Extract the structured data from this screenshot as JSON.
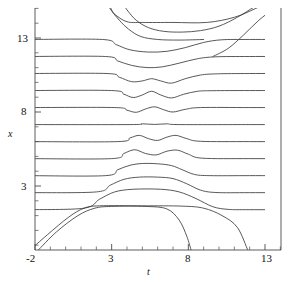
{
  "figure": {
    "background": "#ffffff",
    "line_color": "#3b3b3b",
    "axis_color": "#4a4a4a"
  },
  "axes": {
    "x_title": "t",
    "y_title": "x",
    "x_ticks_labeled": [
      "-2",
      "3",
      "8",
      "13"
    ],
    "y_ticks_labeled": [
      "3",
      "8",
      "13"
    ]
  },
  "chart_data": {
    "type": "line",
    "title": "",
    "xlabel": "t",
    "ylabel": "x",
    "xlim": [
      -2.4,
      15.2
    ],
    "ylim": [
      -1.4,
      15.6
    ],
    "grid": false,
    "legend": null,
    "x_ticks_labeled": [
      -2,
      3,
      8,
      13
    ],
    "x_ticks_minor_step": 1,
    "y_ticks_labeled": [
      3,
      8,
      13
    ],
    "y_ticks_minor_step": 1,
    "baseline_count": 13,
    "baselines": [
      14.05,
      12.9,
      11.75,
      10.6,
      9.45,
      8.3,
      7.15,
      6.0,
      4.85,
      3.7,
      2.55,
      1.4,
      0.3
    ],
    "series": [
      {
        "name": "trace-1-top-kink-pair",
        "baseline": 14.05,
        "kind": "kink-pair-outbound",
        "points": [
          [
            -2.4,
            15.6
          ],
          [
            2.1,
            15.6
          ],
          [
            3.2,
            14.6
          ],
          [
            4.0,
            14.1
          ],
          [
            5.0,
            14.05
          ],
          [
            7.0,
            14.05
          ],
          [
            9.2,
            14.05
          ],
          [
            11.0,
            14.4
          ],
          [
            12.4,
            15.0
          ],
          [
            13.6,
            15.6
          ]
        ]
      },
      {
        "name": "trace-2-deep-well",
        "baseline": 12.9,
        "kind": "broad-well",
        "points": [
          [
            -2.4,
            12.9
          ],
          [
            2.4,
            12.9
          ],
          [
            3.3,
            12.55
          ],
          [
            4.2,
            12.2
          ],
          [
            5.4,
            12.05
          ],
          [
            6.6,
            12.1
          ],
          [
            7.8,
            12.35
          ],
          [
            9.0,
            12.7
          ],
          [
            10.2,
            12.88
          ],
          [
            12.0,
            12.9
          ],
          [
            15.2,
            12.9
          ]
        ]
      },
      {
        "name": "trace-3-well",
        "baseline": 11.75,
        "kind": "well",
        "points": [
          [
            -2.4,
            11.75
          ],
          [
            2.6,
            11.75
          ],
          [
            3.4,
            11.45
          ],
          [
            4.3,
            11.15
          ],
          [
            5.3,
            11.0
          ],
          [
            6.3,
            11.05
          ],
          [
            7.4,
            11.3
          ],
          [
            8.6,
            11.6
          ],
          [
            9.8,
            11.73
          ],
          [
            12.0,
            11.75
          ],
          [
            15.2,
            11.75
          ]
        ]
      },
      {
        "name": "trace-4-double-well",
        "baseline": 10.6,
        "kind": "double-well",
        "points": [
          [
            -2.4,
            10.6
          ],
          [
            2.7,
            10.6
          ],
          [
            3.5,
            10.35
          ],
          [
            4.3,
            10.05
          ],
          [
            5.0,
            10.1
          ],
          [
            5.6,
            10.25
          ],
          [
            6.2,
            10.1
          ],
          [
            6.9,
            9.95
          ],
          [
            7.8,
            10.25
          ],
          [
            8.8,
            10.5
          ],
          [
            9.9,
            10.58
          ],
          [
            12.0,
            10.6
          ],
          [
            15.2,
            10.6
          ]
        ]
      },
      {
        "name": "trace-5-split-well",
        "baseline": 9.45,
        "kind": "double-well",
        "points": [
          [
            -2.4,
            9.45
          ],
          [
            3.0,
            9.45
          ],
          [
            3.8,
            9.2
          ],
          [
            4.4,
            8.98
          ],
          [
            5.0,
            9.15
          ],
          [
            5.6,
            9.4
          ],
          [
            6.2,
            9.15
          ],
          [
            6.9,
            8.95
          ],
          [
            7.7,
            9.2
          ],
          [
            8.6,
            9.4
          ],
          [
            9.6,
            9.44
          ],
          [
            12.0,
            9.45
          ],
          [
            15.2,
            9.45
          ]
        ]
      },
      {
        "name": "trace-6-shallow-wells",
        "baseline": 8.3,
        "kind": "double-well-shallow",
        "points": [
          [
            -2.4,
            8.3
          ],
          [
            3.2,
            8.3
          ],
          [
            4.0,
            8.12
          ],
          [
            4.6,
            7.98
          ],
          [
            5.2,
            8.2
          ],
          [
            5.8,
            8.35
          ],
          [
            6.4,
            8.15
          ],
          [
            7.0,
            8.0
          ],
          [
            7.8,
            8.18
          ],
          [
            8.8,
            8.3
          ],
          [
            12.0,
            8.3
          ],
          [
            15.2,
            8.3
          ]
        ]
      },
      {
        "name": "trace-7-neutral",
        "baseline": 7.15,
        "kind": "flat",
        "points": [
          [
            -2.4,
            7.15
          ],
          [
            4.2,
            7.15
          ],
          [
            5.0,
            7.2
          ],
          [
            5.8,
            7.16
          ],
          [
            6.6,
            7.2
          ],
          [
            7.4,
            7.15
          ],
          [
            12.0,
            7.15
          ],
          [
            15.2,
            7.15
          ]
        ]
      },
      {
        "name": "trace-8-twin-bumps",
        "baseline": 6.0,
        "kind": "double-bump",
        "points": [
          [
            -2.4,
            6.0
          ],
          [
            3.4,
            6.0
          ],
          [
            4.2,
            6.25
          ],
          [
            4.8,
            6.42
          ],
          [
            5.4,
            6.2
          ],
          [
            6.0,
            6.08
          ],
          [
            6.6,
            6.3
          ],
          [
            7.2,
            6.42
          ],
          [
            7.9,
            6.2
          ],
          [
            8.8,
            6.02
          ],
          [
            12.0,
            6.0
          ],
          [
            15.2,
            6.0
          ]
        ]
      },
      {
        "name": "trace-9-merging-bumps",
        "baseline": 4.85,
        "kind": "double-bump",
        "points": [
          [
            -2.4,
            4.85
          ],
          [
            3.0,
            4.85
          ],
          [
            3.8,
            5.2
          ],
          [
            4.5,
            5.45
          ],
          [
            5.2,
            5.2
          ],
          [
            5.9,
            5.1
          ],
          [
            6.6,
            5.35
          ],
          [
            7.3,
            5.42
          ],
          [
            8.0,
            5.15
          ],
          [
            8.9,
            4.88
          ],
          [
            12.0,
            4.85
          ],
          [
            15.2,
            4.85
          ]
        ]
      },
      {
        "name": "trace-10-broad-bump",
        "baseline": 3.7,
        "kind": "broad-bump",
        "points": [
          [
            -2.4,
            3.7
          ],
          [
            2.6,
            3.7
          ],
          [
            3.4,
            4.1
          ],
          [
            4.2,
            4.4
          ],
          [
            5.0,
            4.52
          ],
          [
            6.0,
            4.5
          ],
          [
            6.9,
            4.38
          ],
          [
            7.6,
            4.1
          ],
          [
            8.4,
            3.78
          ],
          [
            9.4,
            3.7
          ],
          [
            12.0,
            3.7
          ],
          [
            15.2,
            3.7
          ]
        ]
      },
      {
        "name": "trace-11-plateau-bump",
        "baseline": 2.55,
        "kind": "plateau",
        "points": [
          [
            -2.4,
            2.55
          ],
          [
            2.0,
            2.6
          ],
          [
            2.9,
            3.05
          ],
          [
            3.8,
            3.45
          ],
          [
            4.8,
            3.6
          ],
          [
            6.0,
            3.6
          ],
          [
            7.0,
            3.5
          ],
          [
            7.9,
            3.15
          ],
          [
            8.8,
            2.72
          ],
          [
            9.8,
            2.56
          ],
          [
            12.0,
            2.55
          ],
          [
            15.2,
            2.55
          ]
        ]
      },
      {
        "name": "trace-12-wide-plateau",
        "baseline": 1.4,
        "kind": "plateau",
        "points": [
          [
            -2.4,
            1.4
          ],
          [
            1.2,
            1.5
          ],
          [
            2.2,
            2.1
          ],
          [
            3.2,
            2.6
          ],
          [
            4.4,
            2.78
          ],
          [
            6.2,
            2.78
          ],
          [
            7.4,
            2.6
          ],
          [
            8.5,
            2.15
          ],
          [
            9.6,
            1.6
          ],
          [
            10.6,
            1.42
          ],
          [
            12.0,
            1.4
          ],
          [
            15.2,
            1.4
          ]
        ]
      },
      {
        "name": "trace-13-bottom-kink-plateau",
        "baseline": 0.3,
        "kind": "plateau-wide",
        "points": [
          [
            -2.4,
            -1.4
          ],
          [
            -1.2,
            -0.3
          ],
          [
            0.2,
            0.9
          ],
          [
            1.2,
            1.5
          ],
          [
            2.2,
            1.66
          ],
          [
            5.0,
            1.66
          ],
          [
            7.6,
            1.64
          ],
          [
            9.0,
            1.5
          ],
          [
            10.2,
            1.0
          ],
          [
            11.2,
            0.2
          ],
          [
            11.9,
            -1.4
          ]
        ]
      },
      {
        "name": "trace-14-bottom-kink-steep",
        "baseline": null,
        "kind": "kink-steep",
        "points": [
          [
            -1.85,
            -1.4
          ],
          [
            -0.6,
            -0.1
          ],
          [
            0.8,
            1.0
          ],
          [
            1.9,
            1.5
          ],
          [
            3.0,
            1.62
          ],
          [
            5.2,
            1.62
          ],
          [
            6.6,
            1.45
          ],
          [
            7.4,
            0.7
          ],
          [
            7.9,
            -0.4
          ],
          [
            8.2,
            -1.4
          ]
        ]
      },
      {
        "name": "trace-15-top-descending-kink-a",
        "baseline": null,
        "kind": "kink-descending",
        "points": [
          [
            2.55,
            15.6
          ],
          [
            2.95,
            14.9
          ],
          [
            3.5,
            14.2
          ],
          [
            4.1,
            13.6
          ],
          [
            4.9,
            13.1
          ],
          [
            6.0,
            12.9
          ],
          [
            7.4,
            12.86
          ],
          [
            9.0,
            12.9
          ]
        ]
      },
      {
        "name": "trace-16-top-descending-kink-b",
        "baseline": null,
        "kind": "kink-descending",
        "points": [
          [
            3.55,
            15.6
          ],
          [
            4.0,
            14.9
          ],
          [
            4.6,
            14.2
          ],
          [
            5.4,
            13.7
          ],
          [
            6.4,
            13.45
          ],
          [
            7.6,
            13.4
          ],
          [
            8.8,
            13.5
          ],
          [
            10.0,
            13.8
          ],
          [
            11.2,
            14.4
          ],
          [
            12.3,
            15.1
          ],
          [
            13.2,
            15.6
          ]
        ]
      },
      {
        "name": "trace-17-top-right-ascending",
        "baseline": null,
        "kind": "kink-ascending",
        "points": [
          [
            9.6,
            11.75
          ],
          [
            10.6,
            12.3
          ],
          [
            11.6,
            13.2
          ],
          [
            12.6,
            14.2
          ],
          [
            13.6,
            15.0
          ],
          [
            14.4,
            15.6
          ]
        ]
      }
    ]
  }
}
